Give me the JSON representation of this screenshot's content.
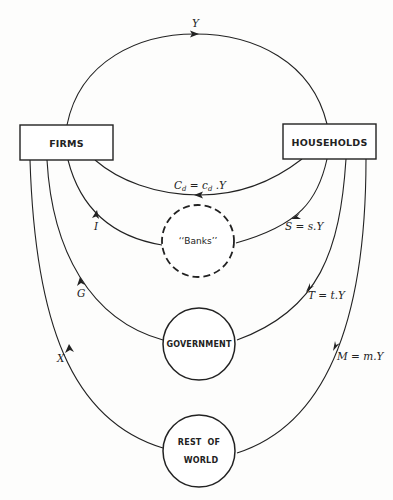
{
  "diagram": {
    "nodes": {
      "firms": {
        "label": "FIRMS"
      },
      "households": {
        "label": "HOUSEHOLDS"
      },
      "banks": {
        "label": "‘‘Banks’’"
      },
      "government": {
        "label": "GOVERNMENT"
      },
      "rest_of_world": {
        "label_line1": "REST  OF",
        "label_line2": "WORLD"
      }
    },
    "flows": {
      "income": {
        "label": "Y",
        "from": "firms",
        "to": "households"
      },
      "consumption": {
        "label": "C",
        "sub": "d",
        "eq": " = c",
        "sub2": "d",
        "tail": " .Y",
        "from": "households",
        "to": "firms"
      },
      "saving": {
        "label": "S = s.Y",
        "from": "households",
        "to": "banks"
      },
      "investment": {
        "label": "I",
        "from": "banks",
        "to": "firms"
      },
      "taxes": {
        "label": "T = t.Y",
        "from": "households",
        "to": "government"
      },
      "government_spending": {
        "label": "G",
        "from": "government",
        "to": "firms"
      },
      "imports": {
        "label": "M = m.Y",
        "from": "households",
        "to": "rest_of_world"
      },
      "exports": {
        "label": "X",
        "from": "rest_of_world",
        "to": "firms"
      }
    }
  }
}
